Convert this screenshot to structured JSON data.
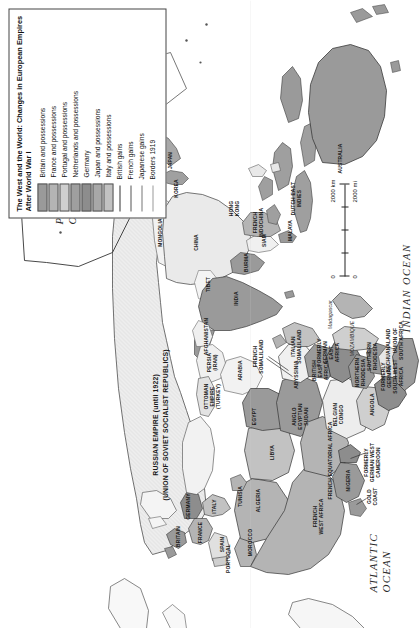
{
  "legend": {
    "title": "The West and the World: Changes in European Empires After World War I",
    "entries": [
      {
        "label": "Britain and possessions",
        "type": "swatch",
        "color": "#9a9a9a"
      },
      {
        "label": "France and possessions",
        "type": "swatch",
        "color": "#b4b4b4"
      },
      {
        "label": "Portugal and possessions",
        "type": "swatch",
        "color": "#cfcfcf"
      },
      {
        "label": "Netherlands and possessions",
        "type": "swatch",
        "color": "#9f9f9f"
      },
      {
        "label": "Germany",
        "type": "swatch",
        "color": "#8d8d8d"
      },
      {
        "label": "Japan and possessions",
        "type": "swatch",
        "color": "#a8a8a8"
      },
      {
        "label": "Italy and possessions",
        "type": "swatch",
        "color": "#c2c2c2"
      },
      {
        "label": "British gains",
        "type": "line",
        "color": "#333333",
        "weight": "1.6px"
      },
      {
        "label": "French gains",
        "type": "line",
        "color": "#555555",
        "weight": "1.1px"
      },
      {
        "label": "Japanese gains",
        "type": "line",
        "color": "#777777",
        "weight": "0.9px"
      },
      {
        "label": "Borders 1919",
        "type": "line",
        "color": "#999999",
        "weight": "0.7px"
      }
    ]
  },
  "scale": {
    "zero_km": "0",
    "zero_mi": "0",
    "km_label": "2000 km",
    "mi_label": "2000 mi"
  },
  "oceans": [
    {
      "name": "ATLANTIC OCEAN",
      "text": "ATLANTIC\nOCEAN"
    },
    {
      "name": "INDIAN OCEAN",
      "text": "INDIAN OCEAN"
    },
    {
      "name": "PACIFIC OCEAN",
      "text": "PACIFIC\nOCEAN"
    }
  ],
  "ocean_labels": {
    "atlantic_line1": "ATLANTIC",
    "atlantic_line2": "OCEAN",
    "indian": "INDIAN  OCEAN",
    "pacific_line1": "PACIFIC",
    "pacific_line2": "OCEAN"
  },
  "annotations": {
    "russian_empire_line1": "RUSSIAN EMPIRE (until 1922)",
    "russian_empire_line2": "(UNION OF SOVIET SOCIALIST REPUBLICS)",
    "to_japan_line1": "TO JAPAN",
    "to_japan_line2": "(formerly German)",
    "to_britain_line1": "TO BRITAIN",
    "to_britain_line2": "(formerly German)",
    "formerly_german_west_cameroon": "FORMERLY\nGERMAN WEST\nCAMEROON"
  },
  "map_labels": [
    {
      "name": "algeria",
      "text": "ALGERIA",
      "x": 128,
      "y": 258
    },
    {
      "name": "libya",
      "text": "LIBYA",
      "x": 176,
      "y": 272
    },
    {
      "name": "egypt",
      "text": "EGYPT",
      "x": 212,
      "y": 254
    },
    {
      "name": "french-west-africa",
      "text": "FRENCH\nWEST AFRICA",
      "x": 112,
      "y": 318
    },
    {
      "name": "anglo-egyptian-sudan",
      "text": "ANGLO\nEGYPTIAN\nSUDAN",
      "x": 212,
      "y": 300
    },
    {
      "name": "abyssinia",
      "text": "ABYSSINIA",
      "x": 254,
      "y": 296
    },
    {
      "name": "french-somaliland",
      "text": "FRENCH\nSOMALILAND",
      "x": 272,
      "y": 258
    },
    {
      "name": "italian-somaliland",
      "text": "ITALIAN\nSOMALILAND",
      "x": 282,
      "y": 296
    },
    {
      "name": "french-equatorial-africa",
      "text": "FRENCH EQUATORIAL AFRICA",
      "x": 168,
      "y": 330
    },
    {
      "name": "nigeria",
      "text": "NIGERIA",
      "x": 148,
      "y": 348
    },
    {
      "name": "gold-coast",
      "text": "GOLD\nCOAST",
      "x": 132,
      "y": 372
    },
    {
      "name": "formerly-german-west-cameroon",
      "text": "FORMERLY\nGERMAN WEST\nCAMEROON",
      "x": 166,
      "y": 372
    },
    {
      "name": "belgian-congo",
      "text": "BELGIAN\nCONGO",
      "x": 214,
      "y": 338
    },
    {
      "name": "british-east-africa",
      "text": "BRITISH\nEAST\nAFRICA",
      "x": 258,
      "y": 320
    },
    {
      "name": "formerly-german-east-africa",
      "text": "FORMERLY\nGERMAN\nEAST\nAFRICA",
      "x": 276,
      "y": 328
    },
    {
      "name": "angola",
      "text": "ANGOLA",
      "x": 224,
      "y": 372
    },
    {
      "name": "northern-rhodesia",
      "text": "NORTHERN\nRHODESIA",
      "x": 256,
      "y": 360
    },
    {
      "name": "southern-rhodesia",
      "text": "SOUTHERN\nRHODESIA",
      "x": 272,
      "y": 372
    },
    {
      "name": "mozambique",
      "text": "MOZAMBIQUE",
      "x": 290,
      "y": 352
    },
    {
      "name": "bechuanaland",
      "text": "BECHUANALAND",
      "x": 278,
      "y": 388
    },
    {
      "name": "union-of-south-africa",
      "text": "UNION OF\nSOUTH AFRICA",
      "x": 288,
      "y": 398
    },
    {
      "name": "formerly-german-south-west-africa",
      "text": "FORMERLY\nGERMAN\nSOUTH WEST\nAFRICA",
      "x": 252,
      "y": 392
    },
    {
      "name": "madagascar",
      "text": "Madagascar",
      "x": 314,
      "y": 330
    },
    {
      "name": "persia-iran",
      "text": "PERSIA\n(IRAN)",
      "x": 266,
      "y": 212
    },
    {
      "name": "arabia",
      "text": "ARABIA",
      "x": 258,
      "y": 240
    },
    {
      "name": "afghanistan",
      "text": "AFGHANISTAN",
      "x": 292,
      "y": 206
    },
    {
      "name": "ottoman-empire-turkey",
      "text": "OTTOMAN\nEMPIRE\n(TURKEY)",
      "x": 232,
      "y": 212
    },
    {
      "name": "india",
      "text": "INDIA",
      "x": 330,
      "y": 236
    },
    {
      "name": "tibet",
      "text": "TIBET",
      "x": 344,
      "y": 208
    },
    {
      "name": "china",
      "text": "CHINA",
      "x": 386,
      "y": 196
    },
    {
      "name": "mongolia",
      "text": "MONGOLIA",
      "x": 396,
      "y": 160
    },
    {
      "name": "manchuria",
      "text": "MANCHURIA",
      "x": 432,
      "y": 142
    },
    {
      "name": "korea",
      "text": "KOREA",
      "x": 440,
      "y": 176
    },
    {
      "name": "burma",
      "text": "BURMA",
      "x": 366,
      "y": 246
    },
    {
      "name": "siam",
      "text": "SIAM",
      "x": 388,
      "y": 264
    },
    {
      "name": "french-indochina",
      "text": "FRENCH\nINDOCHINA",
      "x": 406,
      "y": 258
    },
    {
      "name": "hong-kong",
      "text": "HONG\nKONG",
      "x": 420,
      "y": 234
    },
    {
      "name": "malaya",
      "text": "MALAYA",
      "x": 398,
      "y": 290
    },
    {
      "name": "dutch-east-indies",
      "text": "DUTCH EAST\nINDIES",
      "x": 430,
      "y": 296
    },
    {
      "name": "australia",
      "text": "AUSTRALIA",
      "x": 470,
      "y": 340
    },
    {
      "name": "japan",
      "text": "JAPAN",
      "x": 468,
      "y": 170
    },
    {
      "name": "portugal",
      "text": "PORTUGAL",
      "x": 70,
      "y": 228
    },
    {
      "name": "spain",
      "text": "SPAIN",
      "x": 84,
      "y": 222
    },
    {
      "name": "france",
      "text": "FRANCE",
      "x": 96,
      "y": 200
    },
    {
      "name": "italy",
      "text": "ITALY",
      "x": 122,
      "y": 214
    },
    {
      "name": "britain",
      "text": "BRITAIN",
      "x": 92,
      "y": 178
    },
    {
      "name": "germany",
      "text": "GERMANY",
      "x": 122,
      "y": 188
    },
    {
      "name": "morocco",
      "text": "MOROCCO",
      "x": 86,
      "y": 250
    },
    {
      "name": "tunisia",
      "text": "TUNISIA",
      "x": 132,
      "y": 240
    }
  ]
}
